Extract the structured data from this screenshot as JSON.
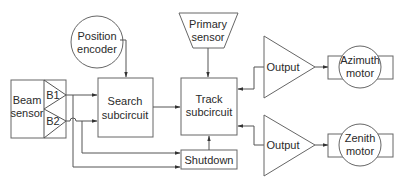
{
  "diagram": {
    "type": "block-diagram",
    "colors": {
      "line": "#555555",
      "text": "#2a2a2a",
      "background": "#ffffff"
    },
    "nodes": {
      "position_encoder": {
        "line1": "Position",
        "line2": "encoder",
        "shape": "circle"
      },
      "primary_sensor": {
        "line1": "Primary",
        "line2": "sensor",
        "shape": "trapezoid"
      },
      "beam_sensor": {
        "line1": "Beam",
        "line2": "sensor",
        "shape": "box",
        "ports": {
          "b1": "B1",
          "b2": "B2"
        }
      },
      "search_subcircuit": {
        "line1": "Search",
        "line2": "subcircuit",
        "shape": "box"
      },
      "track_subcircuit": {
        "line1": "Track",
        "line2": "subcircuit",
        "shape": "box"
      },
      "shutdown": {
        "label": "Shutdown",
        "shape": "box"
      },
      "output_azimuth": {
        "label": "Output",
        "shape": "triangle"
      },
      "output_zenith": {
        "label": "Output",
        "shape": "triangle"
      },
      "azimuth_motor": {
        "line1": "Azimuth",
        "line2": "motor",
        "shape": "motor"
      },
      "zenith_motor": {
        "line1": "Zenith",
        "line2": "motor",
        "shape": "motor"
      }
    },
    "edges": [
      {
        "from": "Position encoder",
        "to": "Search subcircuit"
      },
      {
        "from": "Primary sensor",
        "to": "Track subcircuit"
      },
      {
        "from": "Beam sensor B1",
        "to": "Search subcircuit"
      },
      {
        "from": "Beam sensor B2",
        "to": "Search subcircuit"
      },
      {
        "from": "Beam sensor B1",
        "to": "Shutdown"
      },
      {
        "from": "Beam sensor B2",
        "to": "Shutdown"
      },
      {
        "from": "Search subcircuit",
        "to": "Track subcircuit"
      },
      {
        "from": "Shutdown",
        "to": "Track subcircuit"
      },
      {
        "from": "Output (azimuth)",
        "to": "Track subcircuit"
      },
      {
        "from": "Output (zenith)",
        "to": "Track subcircuit"
      },
      {
        "from": "Output (azimuth)",
        "to": "Azimuth motor"
      },
      {
        "from": "Output (zenith)",
        "to": "Zenith motor"
      }
    ]
  }
}
